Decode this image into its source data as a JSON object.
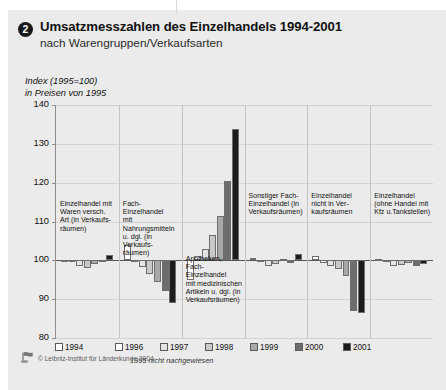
{
  "header": {
    "number": "2",
    "title": "Umsatzmesszahlen des Einzelhandels 1994-2001",
    "subtitle": "nach Warengruppen/Verkaufsarten"
  },
  "axis_caption_line1": "Index (1995=100)",
  "axis_caption_line2": "in Preisen von 1995",
  "legend": {
    "note": "1995 nicht nachgewiesen",
    "items": [
      {
        "label": "1994",
        "color": "#ffffff"
      },
      {
        "label": "1996",
        "color": "#ffffff"
      },
      {
        "label": "1997",
        "color": "#e3e3e3"
      },
      {
        "label": "1998",
        "color": "#c9c9c9"
      },
      {
        "label": "1999",
        "color": "#a8a8a8"
      },
      {
        "label": "2000",
        "color": "#6d6d6d"
      },
      {
        "label": "2001",
        "color": "#1c1c1c"
      }
    ]
  },
  "footer": {
    "copyright": "© Leibniz-Institut für Länderkunde 2004"
  },
  "chart_data": {
    "type": "bar",
    "title": "Umsatzmesszahlen des Einzelhandels 1994-2001",
    "subtitle": "nach Warengruppen/Verkaufsarten",
    "ylabel": "Index (1995=100) in Preisen von 1995",
    "xlabel": "",
    "ylim": [
      80,
      140
    ],
    "yticks": [
      80,
      90,
      100,
      110,
      120,
      130,
      140
    ],
    "baseline": 100,
    "grid": true,
    "legend_position": "bottom",
    "categories": [
      "Einzelhandel mit Waren versch. Art (in Verkaufsräumen)",
      "Fach-Einzelhandel mit Nahrungsmitteln u. dgl. (in Verkaufsräumen)",
      "Apotheken, Fach-Einzelhandel mit medizinischen Artikeln u. dgl. (in Verkaufsräumen)",
      "Sonstiger Fach-Einzelhandel (in Verkaufsräumen)",
      "Einzelhandel nicht in Verkaufsräumen",
      "Einzelhandel (ohne Handel mit Kfz u.Tankstellen)"
    ],
    "category_labels": [
      "Einzelhandel mit\nWaren versch.\nArt (in Verkaufs-\nräumen)",
      "Fach-Einzelhandel\nmit Nahrungsmitteln\nu. dgl. (in Verkaufs-\nräumen)",
      "Apotheken,\nFach-Einzelhandel\nmit medizinischen\nArtikeln u. dgl. (in\nVerkaufsräumen)",
      "Sonstiger Fach-\nEinzelhandel (in\nVerkaufsräumen)",
      "Einzelhandel\nnicht in Ver-\nkaufsräumen",
      "Einzelhandel\n(ohne Handel mit\nKfz u.Tankstellen)"
    ],
    "series": [
      {
        "name": "1994",
        "color": "#ffffff",
        "values": [
          100.2,
          104.0,
          95.0,
          100.6,
          101.0,
          100.3
        ]
      },
      {
        "name": "1996",
        "color": "#ffffff",
        "values": [
          99.8,
          99.6,
          101.0,
          99.6,
          99.4,
          99.7
        ]
      },
      {
        "name": "1997",
        "color": "#e3e3e3",
        "values": [
          98.6,
          98.3,
          103.0,
          98.6,
          98.6,
          98.6
        ]
      },
      {
        "name": "1998",
        "color": "#c9c9c9",
        "values": [
          98.0,
          96.5,
          106.5,
          99.0,
          97.8,
          98.8
        ]
      },
      {
        "name": "1999",
        "color": "#a8a8a8",
        "values": [
          99.0,
          94.5,
          111.5,
          100.4,
          96.0,
          99.4
        ]
      },
      {
        "name": "2000",
        "color": "#6d6d6d",
        "values": [
          99.6,
          92.0,
          120.5,
          99.4,
          87.0,
          98.6
        ]
      },
      {
        "name": "2001",
        "color": "#1c1c1c",
        "values": [
          101.4,
          89.0,
          133.8,
          101.6,
          86.5,
          99.0
        ]
      }
    ]
  }
}
